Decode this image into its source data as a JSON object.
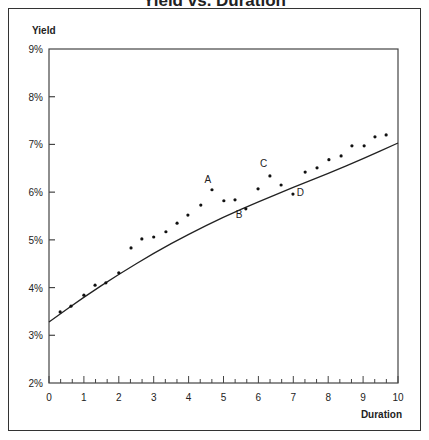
{
  "chart_data": {
    "type": "scatter",
    "title": "Yield vs. Duration",
    "xlabel": "Duration",
    "ylabel": "Yield",
    "xlim": [
      0,
      10
    ],
    "ylim": [
      2,
      9
    ],
    "x_ticks": [
      "0",
      "1",
      "2",
      "3",
      "4",
      "5",
      "6",
      "7",
      "8",
      "9",
      "10"
    ],
    "y_ticks": [
      "2%",
      "3%",
      "4%",
      "5%",
      "6%",
      "7%",
      "8%",
      "9%"
    ],
    "grid": false,
    "legend": null,
    "series": [
      {
        "name": "Observed yields",
        "kind": "scatter",
        "points": [
          {
            "x": 0.32,
            "y": 3.49
          },
          {
            "x": 0.63,
            "y": 3.61
          },
          {
            "x": 1.0,
            "y": 3.84
          },
          {
            "x": 1.32,
            "y": 4.05
          },
          {
            "x": 1.63,
            "y": 4.1
          },
          {
            "x": 2.0,
            "y": 4.31
          },
          {
            "x": 2.35,
            "y": 4.83
          },
          {
            "x": 2.66,
            "y": 5.02
          },
          {
            "x": 3.0,
            "y": 5.06
          },
          {
            "x": 3.35,
            "y": 5.17
          },
          {
            "x": 3.67,
            "y": 5.35
          },
          {
            "x": 3.98,
            "y": 5.52
          },
          {
            "x": 4.35,
            "y": 5.73
          },
          {
            "x": 4.67,
            "y": 6.05,
            "label": "A"
          },
          {
            "x": 5.01,
            "y": 5.82
          },
          {
            "x": 5.33,
            "y": 5.84
          },
          {
            "x": 5.64,
            "y": 5.65,
            "label": "B"
          },
          {
            "x": 5.99,
            "y": 6.07
          },
          {
            "x": 6.33,
            "y": 6.34,
            "label": "C"
          },
          {
            "x": 6.65,
            "y": 6.15
          },
          {
            "x": 6.99,
            "y": 5.96,
            "label": "D"
          },
          {
            "x": 7.34,
            "y": 6.42
          },
          {
            "x": 7.68,
            "y": 6.51
          },
          {
            "x": 8.02,
            "y": 6.68
          },
          {
            "x": 8.37,
            "y": 6.76
          },
          {
            "x": 8.68,
            "y": 6.97
          },
          {
            "x": 9.03,
            "y": 6.97
          },
          {
            "x": 9.34,
            "y": 7.16
          },
          {
            "x": 9.66,
            "y": 7.2
          }
        ]
      },
      {
        "name": "Fitted yield curve",
        "kind": "line",
        "points": [
          {
            "x": 0,
            "y": 3.28
          },
          {
            "x": 1,
            "y": 3.8
          },
          {
            "x": 2,
            "y": 4.28
          },
          {
            "x": 3,
            "y": 4.72
          },
          {
            "x": 4,
            "y": 5.12
          },
          {
            "x": 5,
            "y": 5.48
          },
          {
            "x": 6,
            "y": 5.8
          },
          {
            "x": 7,
            "y": 6.1
          },
          {
            "x": 8,
            "y": 6.39
          },
          {
            "x": 9,
            "y": 6.7
          },
          {
            "x": 10,
            "y": 7.03
          }
        ]
      }
    ],
    "annotations": [
      {
        "text": "A",
        "x": 4.55,
        "y": 6.2
      },
      {
        "text": "B",
        "x": 5.45,
        "y": 5.45
      },
      {
        "text": "C",
        "x": 6.15,
        "y": 6.52
      },
      {
        "text": "D",
        "x": 7.2,
        "y": 5.92
      }
    ]
  }
}
